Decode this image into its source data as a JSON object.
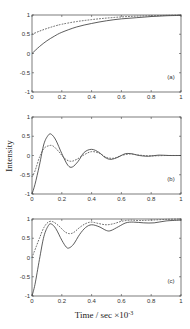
{
  "figure": {
    "ylabel": "Intensity",
    "xlabel": "Time / sec ×10",
    "xlabel_exponent": "-3"
  },
  "chart_data": [
    {
      "type": "line",
      "panel_label": "(a)",
      "xlim": [
        0,
        1
      ],
      "ylim": [
        -1,
        1
      ],
      "xticks": [
        "0",
        "0.2",
        "0.4",
        "0.6",
        "0.8",
        "1"
      ],
      "yticks": [
        "1",
        "0.5",
        "0",
        "-0.5",
        "-1"
      ],
      "grid": false,
      "series": [
        {
          "name": "solid",
          "style": "solid",
          "x": [
            0,
            0.05,
            0.1,
            0.15,
            0.2,
            0.3,
            0.4,
            0.5,
            0.6,
            0.7,
            0.8,
            0.9,
            1.0
          ],
          "y": [
            0,
            0.18,
            0.33,
            0.45,
            0.55,
            0.69,
            0.78,
            0.85,
            0.9,
            0.93,
            0.96,
            0.98,
            0.99
          ]
        },
        {
          "name": "dotted",
          "style": "dotted",
          "x": [
            0,
            0.05,
            0.1,
            0.15,
            0.2,
            0.3,
            0.4,
            0.5,
            0.6,
            0.7,
            0.8,
            0.9,
            1.0
          ],
          "y": [
            0.5,
            0.58,
            0.65,
            0.71,
            0.76,
            0.83,
            0.88,
            0.92,
            0.95,
            0.97,
            0.98,
            0.99,
            1.0
          ]
        }
      ]
    },
    {
      "type": "line",
      "panel_label": "(b)",
      "xlim": [
        0,
        1
      ],
      "ylim": [
        -1,
        1
      ],
      "xticks": [
        "0",
        "0.2",
        "0.4",
        "0.6",
        "0.8",
        "1"
      ],
      "yticks": [
        "1",
        "0.5",
        "0",
        "-0.5",
        "-1"
      ],
      "grid": false,
      "series": [
        {
          "name": "solid",
          "style": "solid",
          "x": [
            0,
            0.02,
            0.05,
            0.08,
            0.11,
            0.13,
            0.16,
            0.2,
            0.24,
            0.27,
            0.31,
            0.35,
            0.4,
            0.45,
            0.49,
            0.53,
            0.58,
            0.62,
            0.66,
            0.72,
            0.78,
            0.85,
            0.92,
            1.0
          ],
          "y": [
            -1,
            -0.75,
            -0.25,
            0.3,
            0.53,
            0.55,
            0.4,
            0.05,
            -0.25,
            -0.3,
            -0.15,
            0.08,
            0.16,
            0.08,
            -0.05,
            -0.1,
            -0.04,
            0.04,
            0.05,
            0.0,
            -0.02,
            0.01,
            0.0,
            0.0
          ]
        },
        {
          "name": "dotted",
          "style": "dotted",
          "x": [
            0,
            0.02,
            0.05,
            0.08,
            0.11,
            0.14,
            0.18,
            0.22,
            0.26,
            0.3,
            0.35,
            0.4,
            0.45,
            0.5,
            0.55,
            0.6,
            0.66,
            0.72,
            0.8,
            0.9,
            1.0
          ],
          "y": [
            -0.55,
            -0.4,
            -0.05,
            0.18,
            0.25,
            0.25,
            0.1,
            -0.08,
            -0.15,
            -0.1,
            0.02,
            0.1,
            0.06,
            -0.05,
            -0.07,
            0.0,
            0.04,
            0.01,
            -0.01,
            0.0,
            0.0
          ]
        }
      ]
    },
    {
      "type": "line",
      "panel_label": "(c)",
      "xlim": [
        0,
        1
      ],
      "ylim": [
        -1,
        1
      ],
      "xticks": [
        "0",
        "0.2",
        "0.4",
        "0.6",
        "0.8",
        "1"
      ],
      "yticks": [
        "1",
        "0.5",
        "0",
        "-0.5",
        "-1"
      ],
      "grid": false,
      "series": [
        {
          "name": "solid",
          "style": "solid",
          "x": [
            0,
            0.02,
            0.05,
            0.08,
            0.11,
            0.13,
            0.16,
            0.2,
            0.23,
            0.25,
            0.28,
            0.32,
            0.36,
            0.4,
            0.45,
            0.5,
            0.53,
            0.58,
            0.63,
            0.68,
            0.75,
            0.82,
            0.9,
            1.0
          ],
          "y": [
            -1,
            -0.7,
            -0.05,
            0.55,
            0.83,
            0.87,
            0.75,
            0.45,
            0.27,
            0.25,
            0.35,
            0.6,
            0.78,
            0.85,
            0.8,
            0.7,
            0.7,
            0.8,
            0.9,
            0.92,
            0.9,
            0.9,
            0.95,
            0.97
          ]
        },
        {
          "name": "dotted",
          "style": "dotted",
          "x": [
            0,
            0.02,
            0.05,
            0.08,
            0.11,
            0.14,
            0.18,
            0.22,
            0.25,
            0.28,
            0.32,
            0.36,
            0.4,
            0.45,
            0.5,
            0.55,
            0.6,
            0.66,
            0.72,
            0.8,
            0.9,
            1.0
          ],
          "y": [
            0.0,
            0.2,
            0.5,
            0.78,
            0.92,
            0.93,
            0.82,
            0.67,
            0.62,
            0.65,
            0.78,
            0.88,
            0.92,
            0.88,
            0.85,
            0.88,
            0.94,
            0.97,
            0.96,
            0.97,
            0.99,
            1.0
          ]
        }
      ]
    }
  ]
}
